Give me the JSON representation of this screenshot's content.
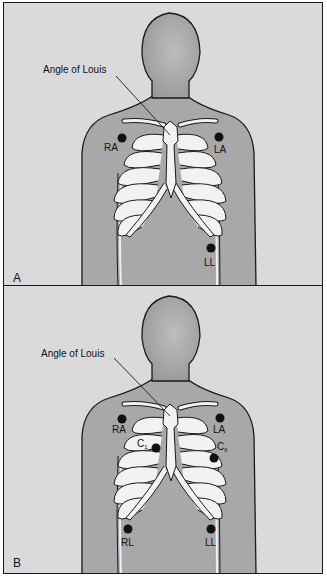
{
  "figure": {
    "colors": {
      "background": "#dadada",
      "body": "#a3a3a3",
      "body_light": "#bdbdbd",
      "bone": "#f2f2f2",
      "outline": "#1a1a1a",
      "electrode": "#111111"
    },
    "panels": [
      {
        "letter": "A",
        "annotation": "Angle of Louis",
        "electrodes": [
          {
            "label": "RA",
            "sub": ""
          },
          {
            "label": "LA",
            "sub": ""
          },
          {
            "label": "LL",
            "sub": ""
          }
        ]
      },
      {
        "letter": "B",
        "annotation": "Angle of Louis",
        "electrodes": [
          {
            "label": "RA",
            "sub": ""
          },
          {
            "label": "LA",
            "sub": ""
          },
          {
            "label": "C",
            "sub": "1"
          },
          {
            "label": "C",
            "sub": "6"
          },
          {
            "label": "RL",
            "sub": ""
          },
          {
            "label": "LL",
            "sub": ""
          }
        ]
      }
    ]
  }
}
